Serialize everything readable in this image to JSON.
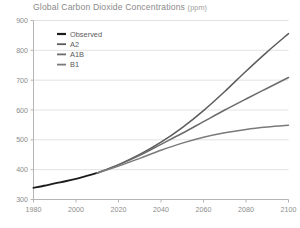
{
  "chart_data": {
    "type": "line",
    "title": "Global Carbon Dioxide Concentrations",
    "title_units": "(ppm)",
    "xlabel": "",
    "ylabel": "",
    "xlim": [
      1980,
      2100
    ],
    "ylim": [
      300,
      900
    ],
    "xticks": [
      1980,
      2000,
      2020,
      2040,
      2060,
      2080,
      2100
    ],
    "yticks": [
      300,
      400,
      500,
      600,
      700,
      800,
      900
    ],
    "grid": "horizontal",
    "legend_position": "top-left",
    "x": [
      1980,
      1990,
      2000,
      2010,
      2020,
      2030,
      2040,
      2050,
      2060,
      2070,
      2080,
      2090,
      2100
    ],
    "series": [
      {
        "name": "Observed",
        "color": "#1c1c1c",
        "width": 1.9,
        "x": [
          1980,
          1985,
          1990,
          1995,
          2000,
          2005,
          2010
        ],
        "values": [
          339,
          346,
          354,
          361,
          369,
          379,
          389
        ]
      },
      {
        "name": "A2",
        "color": "#5c5c5c",
        "width": 1.5,
        "x": [
          2010,
          2020,
          2030,
          2040,
          2050,
          2060,
          2070,
          2080,
          2090,
          2100
        ],
        "values": [
          389,
          417,
          451,
          492,
          541,
          598,
          662,
          730,
          795,
          856
        ]
      },
      {
        "name": "A1B",
        "color": "#6b6b6b",
        "width": 1.5,
        "x": [
          2010,
          2020,
          2030,
          2040,
          2050,
          2060,
          2070,
          2080,
          2090,
          2100
        ],
        "values": [
          389,
          416,
          448,
          485,
          522,
          561,
          600,
          637,
          673,
          709
        ]
      },
      {
        "name": "B1",
        "color": "#7a7a7a",
        "width": 1.5,
        "x": [
          2010,
          2020,
          2030,
          2040,
          2050,
          2060,
          2070,
          2080,
          2090,
          2100
        ],
        "values": [
          389,
          412,
          438,
          465,
          489,
          509,
          524,
          535,
          543,
          549
        ]
      }
    ]
  },
  "legend": {
    "items": [
      {
        "label": "Observed"
      },
      {
        "label": "A2"
      },
      {
        "label": "A1B"
      },
      {
        "label": "B1"
      }
    ]
  },
  "colors": {
    "background": "#ffffff",
    "grid": "#e2e2e2",
    "axis": "#b5b5b5",
    "tick_text": "#8c8c8c",
    "title_text": "#8a8a8a"
  }
}
